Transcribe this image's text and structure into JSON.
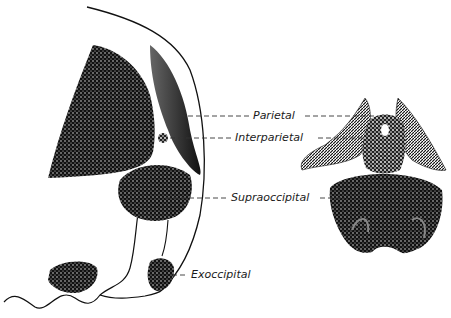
{
  "figure": {
    "type": "anatomical illustration",
    "views": [
      {
        "id": "lateral",
        "description": "Lateral view of skull region with outline"
      },
      {
        "id": "posterior",
        "description": "Posterior view of occipital region"
      }
    ],
    "labels": [
      {
        "id": "parietal",
        "text": "Parietal"
      },
      {
        "id": "interparietal",
        "text": "Interparietal"
      },
      {
        "id": "supraoccipital",
        "text": "Supraoccipital"
      },
      {
        "id": "exoccipital",
        "text": "Exoccipital"
      }
    ],
    "colors": {
      "ink": "#111111",
      "background": "#ffffff",
      "leader": "#333333"
    }
  }
}
